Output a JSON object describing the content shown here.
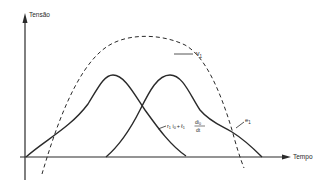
{
  "diagram": {
    "title": "",
    "axes": {
      "y_label": "Tensão",
      "x_label": "Tempo"
    },
    "curves": [
      {
        "name": "v1",
        "label": "v",
        "subscript": "1",
        "style": "dashed",
        "description": "Tensão de alimentação"
      },
      {
        "name": "e1",
        "label": "e",
        "subscript": "1",
        "style": "solid"
      },
      {
        "name": "r1-i0-plus-l1-di0-dt",
        "style": "solid",
        "label_parts": {
          "r": "r",
          "r_sub": "1",
          "i": "i",
          "i_sub": "0",
          "plus": "+",
          "l": "ℓ",
          "l_sub": "1",
          "num": "di",
          "num_sub": "0",
          "den": "dt"
        }
      }
    ],
    "colors": {
      "line": "#2a2a2a",
      "background": "#ffffff"
    }
  }
}
